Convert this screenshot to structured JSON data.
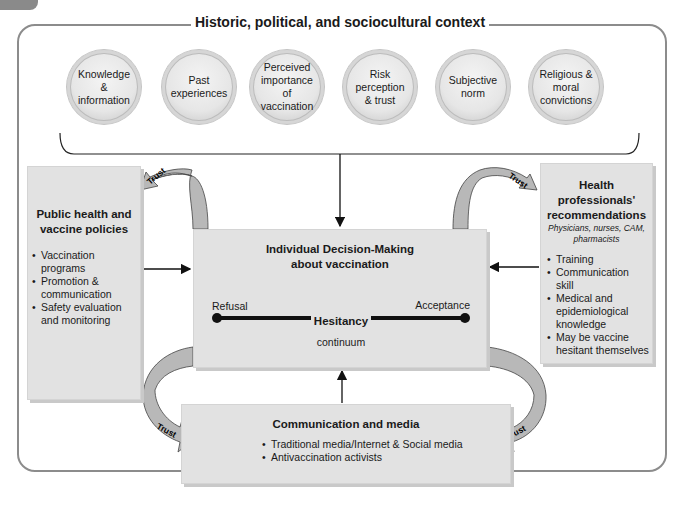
{
  "context_title": "Historic, political, and sociocultural context",
  "factors": [
    {
      "label": "Knowledge\n&\ninformation"
    },
    {
      "label": "Past\nexperiences"
    },
    {
      "label": "Perceived\nimportance\nof\nvaccination"
    },
    {
      "label": "Risk\nperception\n& trust"
    },
    {
      "label": "Subjective\nnorm"
    },
    {
      "label": "Religious &\nmoral\nconvictions"
    }
  ],
  "public_health": {
    "title": "Public health and vaccine policies",
    "items": [
      "Vaccination programs",
      "Promotion & communication",
      "Safety evaluation and monitoring"
    ]
  },
  "health_professionals": {
    "title": "Health professionals' recommendations",
    "subtitle": "Physicians, nurses, CAM, pharmacists",
    "items": [
      "Training",
      "Communication skill",
      "Medical and epidemiological knowledge",
      "May be vaccine hesitant themselves"
    ]
  },
  "decision": {
    "title": "Individual Decision-Making about vaccination",
    "left_label": "Refusal",
    "right_label": "Acceptance",
    "center_label": "Hesitancy",
    "bottom_label": "continuum"
  },
  "media": {
    "title": "Communication and media",
    "items": [
      "Traditional media/Internet & Social media",
      "Antivaccination activists"
    ]
  },
  "trust_labels": [
    "Trust",
    "Trust",
    "Trust",
    "Trust"
  ],
  "colors": {
    "box": "#e2e2e2",
    "frame": "#8c8c8c",
    "arrow_fill": "#b5b5b5",
    "line": "#111111"
  }
}
